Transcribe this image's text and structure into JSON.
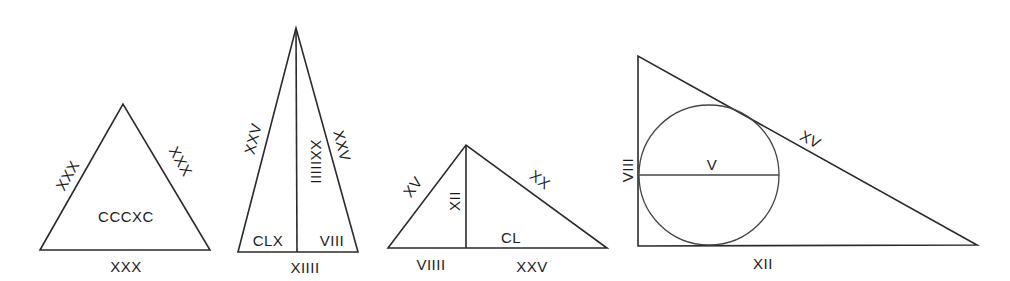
{
  "figures": [
    {
      "id": "equilateral-triangle",
      "labels": {
        "left_side": "XXX",
        "right_side": "XXX",
        "base": "XXX",
        "area": "CCCXC"
      }
    },
    {
      "id": "isosceles-triangle-with-altitude",
      "labels": {
        "left_side": "XXV",
        "right_side": "XXV",
        "altitude": "XXIIIII",
        "base": "XIIII",
        "left_area": "CLX",
        "right_area": "VIII"
      }
    },
    {
      "id": "scalene-triangle-with-altitude",
      "labels": {
        "left_side": "XV",
        "right_side": "XX",
        "altitude": "XII",
        "left_base": "VIIII",
        "right_base": "XXV",
        "area": "CL"
      }
    },
    {
      "id": "right-triangle-with-inscribed-circle",
      "labels": {
        "vertical_leg": "VIII",
        "horizontal_leg": "XII",
        "hypotenuse": "XV",
        "diameter": "V"
      }
    }
  ]
}
